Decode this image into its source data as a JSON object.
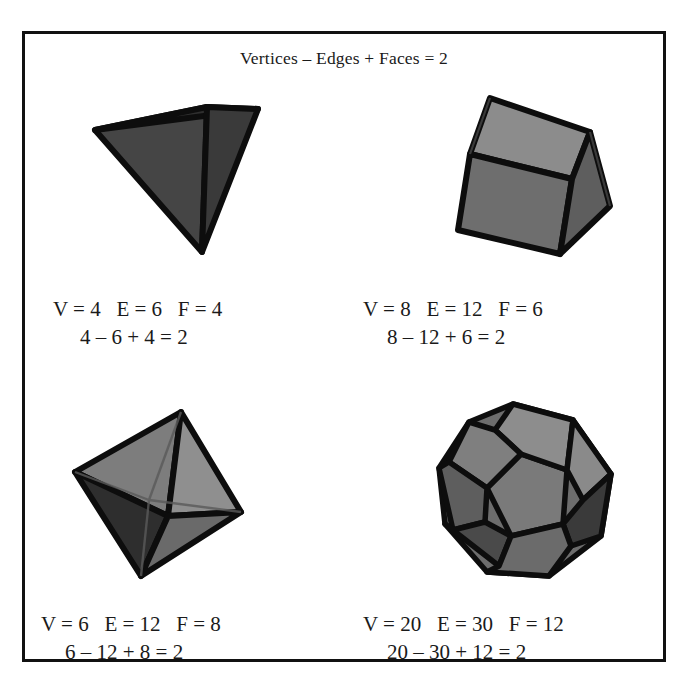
{
  "figure": {
    "title": "Vertices – Edges + Faces = 2",
    "background_color": "#ffffff",
    "frame_color": "#111111",
    "text_color": "#1a1a1a"
  },
  "solids": [
    {
      "name": "tetrahedron",
      "counts_label": "V = 4   E = 6   F = 4",
      "sum_label": "4 – 6 + 4 = 2",
      "vertices": 4,
      "edges": 6,
      "faces": 4,
      "euler_characteristic": 2,
      "face_colors": [
        "#3a3a3a",
        "#2f2f2f",
        "#454545"
      ],
      "edge_color": "#0d0d0d"
    },
    {
      "name": "cube",
      "counts_label": "V = 8   E = 12   F = 6",
      "sum_label": "8 – 12 + 6 = 2",
      "vertices": 8,
      "edges": 12,
      "faces": 6,
      "euler_characteristic": 2,
      "face_colors": [
        "#8c8c8c",
        "#707070",
        "#5e5e5e"
      ],
      "edge_color": "#0d0d0d"
    },
    {
      "name": "octahedron",
      "counts_label": "V = 6   E = 12   F = 8",
      "sum_label": "6 – 12 + 8 = 2",
      "vertices": 6,
      "edges": 12,
      "faces": 8,
      "euler_characteristic": 2,
      "face_colors": [
        "#7d7d7d",
        "#8a8a8a",
        "#2e2e2e",
        "#6a6a6a"
      ],
      "edge_color": "#0d0d0d"
    },
    {
      "name": "dodecahedron",
      "counts_label": "V = 20   E = 30   F = 12",
      "sum_label": "20 – 30 + 12 = 2",
      "vertices": 20,
      "edges": 30,
      "faces": 12,
      "euler_characteristic": 2,
      "face_colors": [
        "#7a7a7a",
        "#8d8d8d",
        "#636363",
        "#3a3a3a",
        "#555555"
      ],
      "edge_color": "#0d0d0d"
    }
  ]
}
